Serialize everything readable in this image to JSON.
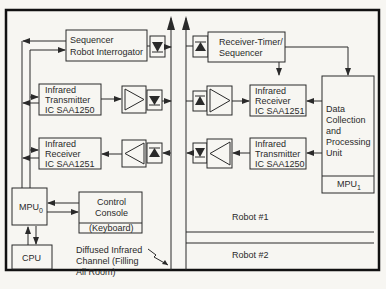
{
  "diagram": {
    "blocks": {
      "sequencer": {
        "line1": "Sequencer",
        "line2": "Robot Interrogator"
      },
      "ir_tx_left": {
        "line1": "Infrared",
        "line2": "Transmitter",
        "line3": "IC SAA1250"
      },
      "ir_rx_left": {
        "line1": "Infrared",
        "line2": "Receiver",
        "line3": "IC SAA1251"
      },
      "mpu0": {
        "label": "MPU",
        "sub": "0"
      },
      "control_console": {
        "line1": "Control",
        "line2": "Console",
        "line3": "(Keyboard)"
      },
      "cpu": {
        "label": "CPU"
      },
      "receiver_timer": {
        "line1": "Receiver-Timer/",
        "line2": "Sequencer"
      },
      "ir_rx_right": {
        "line1": "Infrared",
        "line2": "Receiver",
        "line3": "IC SAA1251"
      },
      "ir_tx_right": {
        "line1": "Infrared",
        "line2": "Transmitter",
        "line3": "IC SAA1250"
      },
      "data_unit": {
        "line1": "Data",
        "line2": "Collection",
        "line3": "and",
        "line4": "Processing",
        "line5": "Unit"
      },
      "mpu1": {
        "label": "MPU",
        "sub": "1"
      }
    },
    "channel_label": {
      "line1": "Diffused Infrared",
      "line2": "Channel (Filling",
      "line3": "All Room)"
    },
    "robots": [
      "Robot #1",
      "Robot #2"
    ]
  }
}
